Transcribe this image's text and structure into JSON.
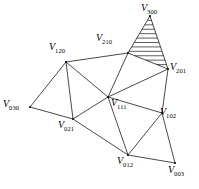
{
  "figure": {
    "name": "barycentric-triangulation-diagram",
    "background_color": "#ffffff",
    "line_color": "#1a1a1a",
    "width": 199,
    "height": 189
  },
  "vertices": [
    {
      "id": "v300",
      "symbol": "V",
      "subscript": "300",
      "x": 150,
      "y": 16,
      "label_x": 141,
      "label_y": 3,
      "label_anchor": "right-of"
    },
    {
      "id": "v210",
      "symbol": "V",
      "subscript": "210",
      "x": 128,
      "y": 53,
      "label_x": 96,
      "label_y": 33,
      "label_anchor": "above-left"
    },
    {
      "id": "v201",
      "symbol": "V",
      "subscript": "201",
      "x": 168,
      "y": 69,
      "label_x": 170,
      "label_y": 62,
      "label_anchor": "right-of"
    },
    {
      "id": "v120",
      "symbol": "V",
      "subscript": "120",
      "x": 66,
      "y": 62,
      "label_x": 49,
      "label_y": 42,
      "label_anchor": "above-left"
    },
    {
      "id": "v111",
      "symbol": "V",
      "subscript": "111",
      "x": 108,
      "y": 97,
      "label_x": 111,
      "label_y": 98,
      "label_anchor": "below-right"
    },
    {
      "id": "v102",
      "symbol": "V",
      "subscript": "102",
      "x": 162,
      "y": 113,
      "label_x": 160,
      "label_y": 107,
      "label_anchor": "right-of"
    },
    {
      "id": "v030",
      "symbol": "V",
      "subscript": "030",
      "x": 30,
      "y": 107,
      "label_x": 3,
      "label_y": 99,
      "label_anchor": "left-of"
    },
    {
      "id": "v021",
      "symbol": "V",
      "subscript": "021",
      "x": 73,
      "y": 119,
      "label_x": 58,
      "label_y": 120,
      "label_anchor": "below-left"
    },
    {
      "id": "v012",
      "symbol": "V",
      "subscript": "012",
      "x": 128,
      "y": 155,
      "label_x": 117,
      "label_y": 156,
      "label_anchor": "below"
    },
    {
      "id": "v003",
      "symbol": "V",
      "subscript": "003",
      "x": 175,
      "y": 163,
      "label_x": 168,
      "label_y": 165,
      "label_anchor": "below-right"
    }
  ],
  "edges": [
    {
      "from": "v300",
      "to": "v210"
    },
    {
      "from": "v300",
      "to": "v201"
    },
    {
      "from": "v210",
      "to": "v201"
    },
    {
      "from": "v210",
      "to": "v120"
    },
    {
      "from": "v210",
      "to": "v111"
    },
    {
      "from": "v201",
      "to": "v111"
    },
    {
      "from": "v201",
      "to": "v102"
    },
    {
      "from": "v120",
      "to": "v030"
    },
    {
      "from": "v120",
      "to": "v021"
    },
    {
      "from": "v120",
      "to": "v111"
    },
    {
      "from": "v030",
      "to": "v021"
    },
    {
      "from": "v021",
      "to": "v111"
    },
    {
      "from": "v021",
      "to": "v012"
    },
    {
      "from": "v111",
      "to": "v012"
    },
    {
      "from": "v111",
      "to": "v102"
    },
    {
      "from": "v012",
      "to": "v102"
    },
    {
      "from": "v012",
      "to": "v003"
    },
    {
      "from": "v102",
      "to": "v003"
    }
  ],
  "hatched_region": {
    "name": "shaded-triangle-300-210-201",
    "vertex_ids": [
      "v300",
      "v210",
      "v201"
    ],
    "hatch_line_count": 11,
    "hatch_direction": "horizontal"
  }
}
